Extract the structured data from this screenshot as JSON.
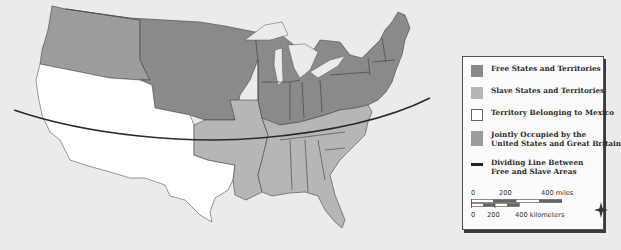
{
  "colors": {
    "free": "#8a8a8a",
    "slave": "#b6b6b6",
    "mexico": "#ffffff",
    "joint": "#9c9c9c",
    "background": "#ebebeb",
    "line": "#2a2a2a"
  },
  "legend": {
    "items": [
      {
        "label": "Free States and Territories",
        "swatch": "free"
      },
      {
        "label": "Slave States and Territories",
        "swatch": "slave"
      },
      {
        "label": "Territory Belonging to Mexico",
        "swatch": "mexico"
      },
      {
        "label_line1": "Jointly Occupied by the",
        "label_line2": "United States and Great Britain",
        "swatch": "joint"
      },
      {
        "label_line1": "Dividing Line Between",
        "label_line2": "Free and Slave Areas",
        "swatch": "line"
      }
    ]
  },
  "scale": {
    "miles": {
      "ticks": [
        "0",
        "200",
        "400 miles"
      ]
    },
    "kilometers": {
      "ticks": [
        "0",
        "200",
        "400 kilometers"
      ]
    }
  },
  "compass": {
    "icon": "compass-rose-icon"
  }
}
